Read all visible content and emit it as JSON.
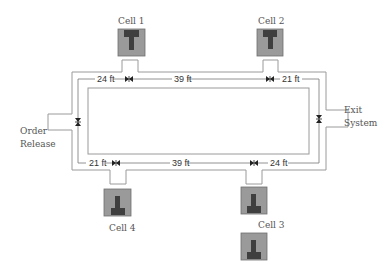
{
  "diagram": {
    "type": "facility-layout-loop",
    "colors": {
      "line": "#999999",
      "dim_line": "#777777",
      "cell_bg": "#9a9a9a",
      "cell_border": "#6f6f6f",
      "machine": "#3f3f3f",
      "label": "#555555"
    },
    "cells": [
      {
        "id": "cell-1",
        "label": "Cell 1",
        "position": "top"
      },
      {
        "id": "cell-2",
        "label": "Cell 2",
        "position": "top"
      },
      {
        "id": "cell-3",
        "label": "Cell 3",
        "position": "bottom"
      },
      {
        "id": "cell-4",
        "label": "Cell 4",
        "position": "bottom"
      }
    ],
    "endpoints": {
      "order_release": {
        "line1": "Order",
        "line2": "Release"
      },
      "exit_system": {
        "line1": "Exit",
        "line2": "System"
      }
    },
    "distances": {
      "top": [
        {
          "label": "24 ft",
          "between": "Order Release corner – Cell 1"
        },
        {
          "label": "39 ft",
          "between": "Cell 1 – Cell 2"
        },
        {
          "label": "21 ft",
          "between": "Cell 2 – Exit corner"
        }
      ],
      "bottom": [
        {
          "label": "21 ft",
          "between": "Order Release corner – Cell 4"
        },
        {
          "label": "39 ft",
          "between": "Cell 4 – Cell 3"
        },
        {
          "label": "24 ft",
          "between": "Cell 3 – Exit corner"
        }
      ]
    }
  }
}
